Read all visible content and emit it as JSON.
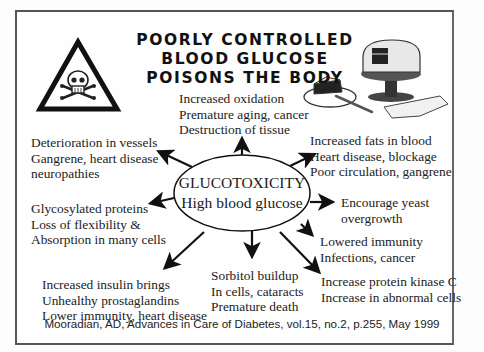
{
  "title": {
    "lines": [
      "POORLY CONTROLLED",
      "BLOOD GLUCOSE",
      "POISONS THE BODY"
    ]
  },
  "icons": {
    "warning": "skull-crossbones-warning-triangle-icon",
    "cake": "cake-illustration"
  },
  "center_node": {
    "line1": "GLUCOTOXICITY",
    "line2": "High blood glucose"
  },
  "effects": {
    "top": [
      "Increased oxidation",
      "Premature aging, cancer",
      "Destruction of tissue"
    ],
    "upper_left": [
      "Deterioration in vessels",
      "Gangrene, heart disease",
      "neuropathies"
    ],
    "upper_right": [
      "Increased fats in blood",
      "Heart disease, blockage",
      "Poor circulation, gangrene"
    ],
    "left": [
      "Glycosylated proteins",
      "Loss of flexibility &",
      "Absorption in many cells"
    ],
    "right": [
      "Encourage yeast",
      "overgrowth"
    ],
    "lower_right": [
      "Lowered immunity",
      "Infections, cancer"
    ],
    "bottom_right": [
      "Increase protein kinase C",
      "Increase in abnormal cells"
    ],
    "bottom": [
      "Sorbitol buildup",
      "In cells, cataracts",
      "Premature death"
    ],
    "bottom_left": [
      "Increased insulin brings",
      "Unhealthy prostaglandins",
      "Lower immunity, heart disease"
    ]
  },
  "citation": "Mooradian, AD, Advances in Care of Diabetes, vol.15, no.2, p.255, May 1999"
}
